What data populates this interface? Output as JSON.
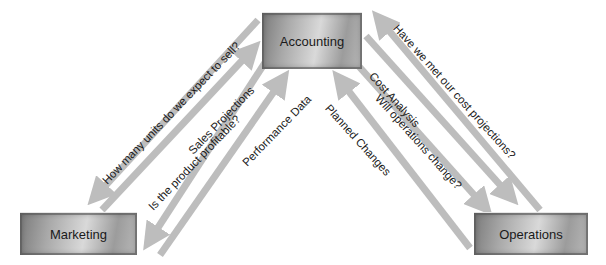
{
  "nodes": {
    "accounting": {
      "label": "Accounting"
    },
    "marketing": {
      "label": "Marketing"
    },
    "operations": {
      "label": "Operations"
    }
  },
  "edges": {
    "left": [
      {
        "label": "How many units do we expect to sell?",
        "from": "Accounting",
        "to": "Marketing"
      },
      {
        "label": "Sales Projections",
        "from": "Marketing",
        "to": "Accounting"
      },
      {
        "label": "Is the product profitable?",
        "from": "Accounting",
        "to": "Marketing"
      },
      {
        "label": "Performance Data",
        "from": "Marketing",
        "to": "Accounting"
      }
    ],
    "right": [
      {
        "label": "Have we met our cost projections?",
        "from": "Operations",
        "to": "Accounting"
      },
      {
        "label": "Cost Analysis",
        "from": "Accounting",
        "to": "Operations"
      },
      {
        "label": "Will operations change?",
        "from": "Accounting",
        "to": "Operations"
      },
      {
        "label": "Planned Changes",
        "from": "Operations",
        "to": "Accounting"
      }
    ]
  },
  "colors": {
    "arrow": "#bdbdbd",
    "box_dark": "#7a7a7a",
    "box_light": "#d9d9d9"
  }
}
